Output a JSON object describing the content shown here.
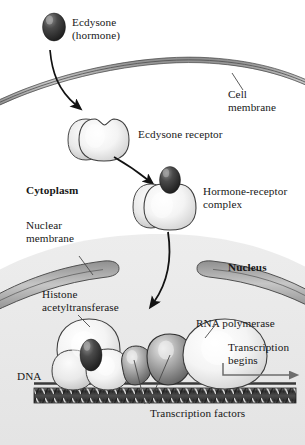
{
  "figure": {
    "type": "biological-diagram",
    "width": 305,
    "height": 445,
    "background": "#ffffff"
  },
  "colors": {
    "hormone_dark": "#2b2b2b",
    "hormone_mid": "#555555",
    "protein_light": "#f2f2f2",
    "protein_shadow": "#c9c9c9",
    "outline": "#3a3a3a",
    "membrane_fill": "#b9b9b9",
    "membrane_stroke": "#4a4a4a",
    "nucleus_fill": "#e7e7e7",
    "dna_dark": "#3d3d3d",
    "dna_light": "#d8d8d8",
    "text": "#171717",
    "transcription_factor": "#9a9a9a"
  },
  "labels": {
    "ecdysone": "Ecdysone\n(hormone)",
    "cell_membrane": "Cell\nmembrane",
    "ecdysone_receptor": "Ecdysone receptor",
    "cytoplasm": "Cytoplasm",
    "hormone_receptor_complex": "Hormone-receptor\ncomplex",
    "nuclear_membrane": "Nuclear\nmembrane",
    "nucleus": "Nucleus",
    "histone_acetyltransferase": "Histone\nacetyltransferase",
    "rna_polymerase": "RNA polymerase",
    "transcription_begins": "Transcription\nbegins",
    "dna": "DNA",
    "transcription_factors": "Transcription factors"
  },
  "structures": [
    {
      "name": "ecdysone-hormone",
      "kind": "hormone",
      "stage": 1
    },
    {
      "name": "cell-membrane",
      "kind": "membrane",
      "stage": 1
    },
    {
      "name": "ecdysone-receptor",
      "kind": "protein",
      "stage": 2
    },
    {
      "name": "hormone-receptor-complex",
      "kind": "protein",
      "stage": 3
    },
    {
      "name": "nuclear-membrane",
      "kind": "membrane",
      "stage": 4
    },
    {
      "name": "histone-acetyltransferase",
      "kind": "protein",
      "stage": 5
    },
    {
      "name": "transcription-factor-1",
      "kind": "protein",
      "stage": 5
    },
    {
      "name": "transcription-factor-2",
      "kind": "protein",
      "stage": 5
    },
    {
      "name": "rna-polymerase",
      "kind": "protein",
      "stage": 5
    },
    {
      "name": "dna-strand",
      "kind": "dna",
      "stage": 5
    }
  ],
  "arrows": [
    {
      "name": "arrow-hormone-into-cell",
      "from": "ecdysone-hormone",
      "to": "ecdysone-receptor"
    },
    {
      "name": "arrow-binding",
      "from": "ecdysone-receptor",
      "to": "hormone-receptor-complex"
    },
    {
      "name": "arrow-into-nucleus",
      "from": "hormone-receptor-complex",
      "to": "dna-strand"
    },
    {
      "name": "arrow-transcription-direction",
      "from": "rna-polymerase",
      "to": "downstream"
    }
  ]
}
